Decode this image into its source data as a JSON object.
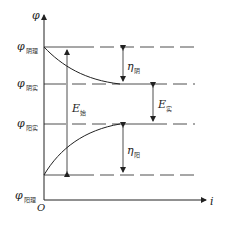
{
  "diagram": {
    "axes": {
      "y_label": "φ",
      "x_label": "i",
      "origin_label": "O"
    },
    "levels": [
      {
        "id": "cathode-theoretical",
        "symbol": "φ",
        "subscript": "阴理"
      },
      {
        "id": "cathode-actual",
        "symbol": "φ",
        "subscript": "阴实"
      },
      {
        "id": "anode-actual",
        "symbol": "φ",
        "subscript": "阳实"
      },
      {
        "id": "anode-theoretical",
        "symbol": "φ",
        "subscript": "阳理"
      }
    ],
    "arrows": [
      {
        "id": "e-start",
        "symbol": "E",
        "subscript": "始"
      },
      {
        "id": "eta-cathode",
        "symbol": "η",
        "subscript": "阴"
      },
      {
        "id": "e-actual",
        "symbol": "E",
        "subscript": "实"
      },
      {
        "id": "eta-anode",
        "symbol": "η",
        "subscript": "阳"
      }
    ]
  }
}
